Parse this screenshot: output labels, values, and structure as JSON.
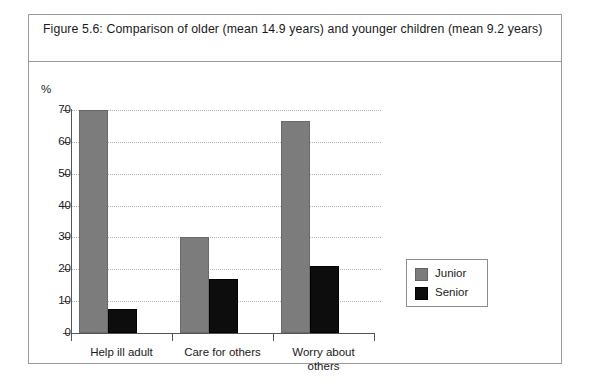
{
  "figure": {
    "caption": "Figure 5.6:  Comparison of older (mean 14.9 years) and younger children (mean 9.2 years)"
  },
  "chart_data": {
    "type": "bar",
    "title": "Figure 5.6:  Comparison of older (mean 14.9 years) and younger children (mean 9.2 years)",
    "xlabel": "",
    "ylabel": "%",
    "ylim": [
      0,
      70
    ],
    "yticks": [
      0,
      10,
      20,
      30,
      40,
      50,
      60,
      70
    ],
    "ytick_labels": [
      "0",
      "10",
      "20",
      "30",
      "40",
      "50",
      "60",
      "70"
    ],
    "categories": [
      "Help ill adult",
      "Care for others",
      "Worry about others"
    ],
    "category_lines": [
      [
        "Help ill adult"
      ],
      [
        "Care for others"
      ],
      [
        "Worry about",
        "others"
      ]
    ],
    "series": [
      {
        "name": "Junior",
        "color": "#7c7c7c",
        "values": [
          70,
          30,
          66.5
        ]
      },
      {
        "name": "Senior",
        "color": "#0d0d0d",
        "values": [
          7.5,
          17,
          21
        ]
      }
    ],
    "legend": {
      "position": "right",
      "entries": [
        {
          "label": "Junior",
          "color": "#7c7c7c"
        },
        {
          "label": "Senior",
          "color": "#0d0d0d"
        }
      ]
    },
    "grid": true,
    "grid_style": "dotted-horizontal"
  }
}
